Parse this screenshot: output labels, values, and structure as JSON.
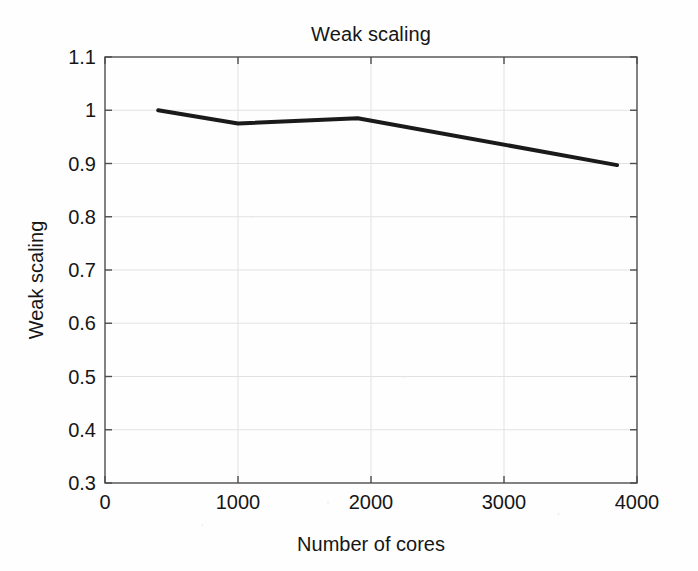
{
  "chart_data": {
    "type": "line",
    "title": "Weak scaling",
    "xlabel": "Number of cores",
    "ylabel": "Weak scaling",
    "xlim": [
      0,
      4000
    ],
    "ylim": [
      0.3,
      1.1
    ],
    "grid": true,
    "legend": null,
    "xticks": [
      0,
      1000,
      2000,
      3000,
      4000
    ],
    "xtick_labels": [
      "0",
      "1000",
      "2000",
      "3000",
      "4000"
    ],
    "yticks": [
      0.3,
      0.4,
      0.5,
      0.6,
      0.7,
      0.8,
      0.9,
      1.0,
      1.1
    ],
    "ytick_labels": [
      "0.3",
      "0.4",
      "0.5",
      "0.6",
      "0.7",
      "0.8",
      "0.9",
      "1",
      "1.1"
    ],
    "series": [
      {
        "name": "Weak scaling",
        "color": "#1a1a1a",
        "linewidth": 4,
        "marker": "none",
        "x": [
          400,
          1000,
          1900,
          3850
        ],
        "values": [
          1.0,
          0.975,
          0.985,
          0.897
        ]
      }
    ]
  },
  "figure": {
    "background_color": "#fefefe",
    "axes_color": "#4d4d4d",
    "grid_color": "#e2e2e2",
    "text_color": "#161616"
  }
}
